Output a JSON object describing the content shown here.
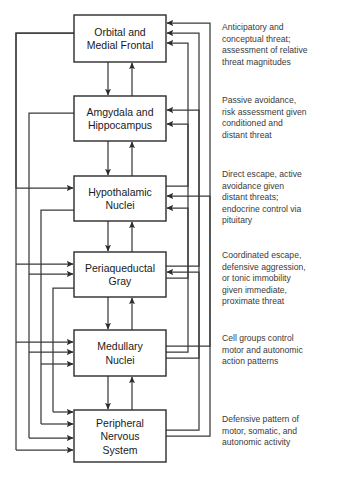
{
  "figure": {
    "width": 339,
    "height": 479,
    "background_color": "#ffffff",
    "line_color": "#3a3a3a",
    "box_border_color": "#2b2b2b",
    "text_color": "#1a1a1a",
    "annotation_color": "#3a3a3a"
  },
  "nodes": [
    {
      "id": "orbital-medial-frontal",
      "lines": [
        "Orbital and",
        "Medial Frontal"
      ],
      "x": 74,
      "y": 15,
      "w": 92,
      "h": 47
    },
    {
      "id": "amygdala-hippocampus",
      "lines": [
        "Amgydala and",
        "Hippocampus"
      ],
      "x": 74,
      "y": 96,
      "w": 92,
      "h": 45
    },
    {
      "id": "hypothalamic-nuclei",
      "lines": [
        "Hypothalamic",
        "Nuclei"
      ],
      "x": 74,
      "y": 176,
      "w": 92,
      "h": 45
    },
    {
      "id": "periaqueductal-gray",
      "lines": [
        "Periaqueductal",
        "Gray"
      ],
      "x": 74,
      "y": 252,
      "w": 92,
      "h": 45
    },
    {
      "id": "medullary-nuclei",
      "lines": [
        "Medullary",
        "Nuclei"
      ],
      "x": 74,
      "y": 330,
      "w": 92,
      "h": 46
    },
    {
      "id": "peripheral-nervous-system",
      "lines": [
        "Peripheral",
        "Nervous",
        "System"
      ],
      "x": 74,
      "y": 410,
      "w": 92,
      "h": 52
    }
  ],
  "annotations": [
    {
      "id": "annotation-orbital",
      "for": "orbital-medial-frontal",
      "x": 222,
      "y": 30,
      "lines": [
        "Anticipatory and",
        "conceptual threat;",
        "assessment of relative",
        "threat magnitudes"
      ]
    },
    {
      "id": "annotation-amygdala",
      "for": "amygdala-hippocampus",
      "x": 222,
      "y": 103,
      "lines": [
        "Passive avoidance,",
        "risk assessment given",
        "conditioned and",
        "distant threat"
      ]
    },
    {
      "id": "annotation-hypothalamic",
      "for": "hypothalamic-nuclei",
      "x": 222,
      "y": 177,
      "lines": [
        "Direct escape, active",
        "avoidance given",
        "distant threats;",
        "endocrine control via",
        "pituitary"
      ]
    },
    {
      "id": "annotation-periaqueductal",
      "for": "periaqueductal-gray",
      "x": 222,
      "y": 258,
      "lines": [
        "Coordinated escape,",
        "defensive aggression,",
        "or tonic immobility",
        "given immediate,",
        "proximate threat"
      ]
    },
    {
      "id": "annotation-medullary",
      "for": "medullary-nuclei",
      "x": 222,
      "y": 341,
      "lines": [
        "Cell groups control",
        "motor and autonomic",
        "action patterns"
      ]
    },
    {
      "id": "annotation-peripheral",
      "for": "peripheral-nervous-system",
      "x": 222,
      "y": 422,
      "lines": [
        "Defensive pattern of",
        "motor, somatic, and",
        "autonomic activity"
      ]
    }
  ],
  "connections": {
    "descending_chain": [
      {
        "from": "orbital-medial-frontal",
        "to": "amygdala-hippocampus"
      },
      {
        "from": "amygdala-hippocampus",
        "to": "hypothalamic-nuclei"
      },
      {
        "from": "hypothalamic-nuclei",
        "to": "periaqueductal-gray"
      },
      {
        "from": "periaqueductal-gray",
        "to": "medullary-nuclei"
      },
      {
        "from": "medullary-nuclei",
        "to": "peripheral-nervous-system"
      }
    ],
    "ascending_chain": [
      {
        "from": "amygdala-hippocampus",
        "to": "orbital-medial-frontal"
      },
      {
        "from": "hypothalamic-nuclei",
        "to": "amygdala-hippocampus"
      },
      {
        "from": "periaqueductal-gray",
        "to": "hypothalamic-nuclei"
      },
      {
        "from": "medullary-nuclei",
        "to": "periaqueductal-gray"
      },
      {
        "from": "peripheral-nervous-system",
        "to": "medullary-nuclei"
      }
    ],
    "descending_long_range": [
      {
        "from": "orbital-medial-frontal",
        "to": "hypothalamic-nuclei"
      },
      {
        "from": "orbital-medial-frontal",
        "to": "periaqueductal-gray"
      },
      {
        "from": "orbital-medial-frontal",
        "to": "medullary-nuclei"
      },
      {
        "from": "orbital-medial-frontal",
        "to": "peripheral-nervous-system"
      },
      {
        "from": "amygdala-hippocampus",
        "to": "periaqueductal-gray"
      },
      {
        "from": "amygdala-hippocampus",
        "to": "medullary-nuclei"
      },
      {
        "from": "amygdala-hippocampus",
        "to": "peripheral-nervous-system"
      },
      {
        "from": "hypothalamic-nuclei",
        "to": "medullary-nuclei"
      },
      {
        "from": "hypothalamic-nuclei",
        "to": "peripheral-nervous-system"
      },
      {
        "from": "periaqueductal-gray",
        "to": "peripheral-nervous-system"
      }
    ],
    "ascending_long_range": [
      {
        "from": "hypothalamic-nuclei",
        "to": "orbital-medial-frontal"
      },
      {
        "from": "periaqueductal-gray",
        "to": "orbital-medial-frontal"
      },
      {
        "from": "periaqueductal-gray",
        "to": "amygdala-hippocampus"
      },
      {
        "from": "medullary-nuclei",
        "to": "orbital-medial-frontal"
      },
      {
        "from": "medullary-nuclei",
        "to": "amygdala-hippocampus"
      },
      {
        "from": "medullary-nuclei",
        "to": "hypothalamic-nuclei"
      },
      {
        "from": "peripheral-nervous-system",
        "to": "hypothalamic-nuclei"
      },
      {
        "from": "peripheral-nervous-system",
        "to": "periaqueductal-gray"
      }
    ]
  }
}
